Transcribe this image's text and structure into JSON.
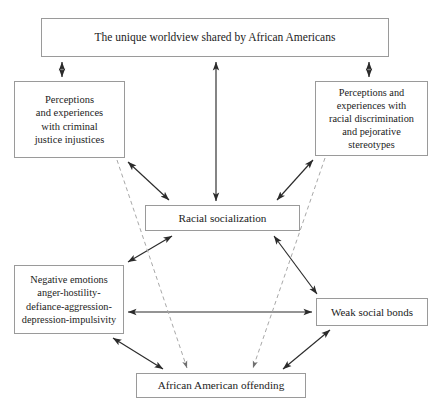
{
  "diagram": {
    "background": "#ffffff",
    "line_color": "#2b2b2b",
    "dashed_line_color": "#a8a8a8",
    "border_color": "#9a9a9a",
    "text_color": "#1b1b1b",
    "nodes": {
      "worldview": {
        "label": "The unique worldview shared by African Americans"
      },
      "criminal_justice": {
        "label": "Perceptions\nand experiences\nwith criminal\njustice injustices"
      },
      "discrimination": {
        "label": "Perceptions and\nexperiences with\nracial discrimination\nand pejorative\nstereotypes"
      },
      "racial_socialization": {
        "label": "Racial socialization"
      },
      "negative_emotions": {
        "label": "Negative emotions\nanger-hostility-\ndefiance-aggression-\ndepression-impulsivity"
      },
      "weak_social_bonds": {
        "label": "Weak social bonds"
      },
      "offending": {
        "label": "African American offending"
      }
    },
    "edges": [
      {
        "name": "worldview-to-criminal-justice",
        "style": "solid",
        "heads": "both",
        "from": "worldview",
        "to": "criminal_justice"
      },
      {
        "name": "worldview-to-racial-socialization",
        "style": "solid",
        "heads": "both",
        "from": "worldview",
        "to": "racial_socialization"
      },
      {
        "name": "worldview-to-discrimination",
        "style": "solid",
        "heads": "both",
        "from": "worldview",
        "to": "discrimination"
      },
      {
        "name": "criminal-justice-to-racial-socialization",
        "style": "solid",
        "heads": "both",
        "from": "criminal_justice",
        "to": "racial_socialization"
      },
      {
        "name": "discrimination-to-racial-socialization",
        "style": "solid",
        "heads": "both",
        "from": "discrimination",
        "to": "racial_socialization"
      },
      {
        "name": "racial-socialization-to-negative-emotions",
        "style": "solid",
        "heads": "both",
        "from": "racial_socialization",
        "to": "negative_emotions"
      },
      {
        "name": "racial-socialization-to-weak-social-bonds",
        "style": "solid",
        "heads": "both",
        "from": "racial_socialization",
        "to": "weak_social_bonds"
      },
      {
        "name": "negative-emotions-to-weak-social-bonds",
        "style": "solid",
        "heads": "both",
        "from": "negative_emotions",
        "to": "weak_social_bonds"
      },
      {
        "name": "negative-emotions-to-offending",
        "style": "solid",
        "heads": "both",
        "from": "negative_emotions",
        "to": "offending"
      },
      {
        "name": "weak-social-bonds-to-offending",
        "style": "solid",
        "heads": "both",
        "from": "weak_social_bonds",
        "to": "offending"
      },
      {
        "name": "criminal-justice-to-offending-dashed",
        "style": "dashed",
        "heads": "end",
        "from": "criminal_justice",
        "to": "offending"
      },
      {
        "name": "discrimination-to-offending-dashed",
        "style": "dashed",
        "heads": "end",
        "from": "discrimination",
        "to": "offending"
      }
    ]
  }
}
